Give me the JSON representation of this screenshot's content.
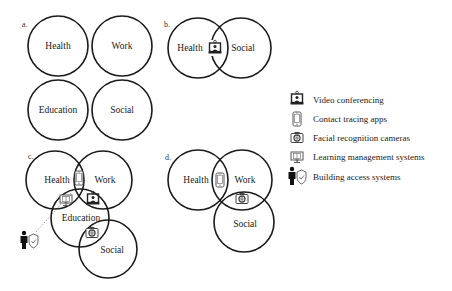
{
  "panels": {
    "a": {
      "label": "a.",
      "circles": [
        {
          "name": "Health",
          "cx": 58,
          "cy": 46,
          "r": 30
        },
        {
          "name": "Work",
          "cx": 122,
          "cy": 46,
          "r": 30
        },
        {
          "name": "Education",
          "cx": 58,
          "cy": 110,
          "r": 30
        },
        {
          "name": "Social",
          "cx": 122,
          "cy": 110,
          "r": 30
        }
      ]
    },
    "b": {
      "label": "b.",
      "circles": [
        {
          "name": "Health",
          "cx": 198,
          "cy": 48,
          "r": 30
        },
        {
          "name": "Social",
          "cx": 241,
          "cy": 48,
          "r": 30
        }
      ],
      "icons": [
        {
          "type": "video-conferencing",
          "x": 215,
          "y": 48
        }
      ]
    },
    "c": {
      "label": "c.",
      "circles": [
        {
          "name": "Health",
          "cx": 55,
          "cy": 180,
          "r": 29
        },
        {
          "name": "Work",
          "cx": 103,
          "cy": 180,
          "r": 29
        },
        {
          "name": "Education",
          "cx": 80,
          "cy": 218,
          "r": 29
        },
        {
          "name": "Social",
          "cx": 108,
          "cy": 249,
          "r": 29
        }
      ],
      "icons": [
        {
          "type": "contact-tracing-app",
          "x": 79,
          "y": 178
        },
        {
          "type": "learning-management-system",
          "x": 66,
          "y": 200
        },
        {
          "type": "video-conferencing",
          "x": 93,
          "y": 199
        },
        {
          "type": "facial-recognition-camera",
          "x": 92,
          "y": 233
        },
        {
          "type": "building-access-system",
          "x": 28,
          "y": 240
        }
      ]
    },
    "d": {
      "label": "d.",
      "circles": [
        {
          "name": "Health",
          "cx": 198,
          "cy": 180,
          "r": 30
        },
        {
          "name": "Work",
          "cx": 242,
          "cy": 180,
          "r": 30
        },
        {
          "name": "Social",
          "cx": 244,
          "cy": 222,
          "r": 30
        }
      ],
      "icons": [
        {
          "type": "contact-tracing-app",
          "x": 220,
          "y": 180
        },
        {
          "type": "facial-recognition-camera",
          "x": 242,
          "y": 199
        }
      ]
    }
  },
  "legend": {
    "items": [
      {
        "icon": "video-conferencing",
        "label": "Video conferencing"
      },
      {
        "icon": "contact-tracing-app",
        "label": "Contact tracing apps"
      },
      {
        "icon": "facial-recognition-camera",
        "label": "Facial recognition cameras"
      },
      {
        "icon": "learning-management-system",
        "label": "Learning management systems"
      },
      {
        "icon": "building-access-system",
        "label": "Building access systems"
      }
    ]
  }
}
